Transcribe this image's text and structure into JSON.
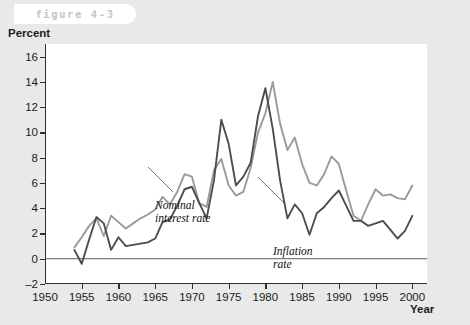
{
  "figure": {
    "tag": "figure 4-3"
  },
  "chart_data": {
    "type": "line",
    "title": "",
    "xlabel": "Year",
    "ylabel": "Percent",
    "xlim": [
      1950,
      2002
    ],
    "ylim": [
      -2,
      17
    ],
    "grid": false,
    "zero_line": true,
    "legend_position": "inline-annotations",
    "xticks": [
      1950,
      1955,
      1960,
      1965,
      1970,
      1975,
      1980,
      1985,
      1990,
      1995,
      2000
    ],
    "yticks": [
      -2,
      0,
      2,
      4,
      6,
      8,
      10,
      12,
      14,
      16
    ],
    "ytick_labels": [
      "–2",
      "0",
      "2",
      "4",
      "6",
      "8",
      "10",
      "12",
      "14",
      "16"
    ],
    "x": [
      1954,
      1955,
      1956,
      1957,
      1958,
      1959,
      1960,
      1961,
      1962,
      1963,
      1964,
      1965,
      1966,
      1967,
      1968,
      1969,
      1970,
      1971,
      1972,
      1973,
      1974,
      1975,
      1976,
      1977,
      1978,
      1979,
      1980,
      1981,
      1982,
      1983,
      1984,
      1985,
      1986,
      1987,
      1988,
      1989,
      1990,
      1991,
      1992,
      1993,
      1994,
      1995,
      1996,
      1997,
      1998,
      1999,
      2000
    ],
    "series": [
      {
        "name": "Nominal interest rate",
        "color": "#9a9a9a",
        "values": [
          0.9,
          1.7,
          2.6,
          3.2,
          1.8,
          3.4,
          2.9,
          2.4,
          2.8,
          3.2,
          3.5,
          3.9,
          4.9,
          4.3,
          5.3,
          6.7,
          6.5,
          4.4,
          4.1,
          7.0,
          7.9,
          5.8,
          5.0,
          5.3,
          7.2,
          10.0,
          11.5,
          14.0,
          10.7,
          8.6,
          9.6,
          7.5,
          6.0,
          5.8,
          6.7,
          8.1,
          7.5,
          5.4,
          3.4,
          3.0,
          4.3,
          5.5,
          5.0,
          5.1,
          4.8,
          4.7,
          5.8
        ]
      },
      {
        "name": "Inflation rate",
        "color": "#4d4d4d",
        "values": [
          0.7,
          -0.4,
          1.5,
          3.3,
          2.8,
          0.7,
          1.7,
          1.0,
          1.1,
          1.2,
          1.3,
          1.6,
          2.9,
          3.1,
          4.2,
          5.5,
          5.7,
          4.4,
          3.2,
          6.2,
          11.0,
          9.1,
          5.8,
          6.5,
          7.6,
          11.3,
          13.5,
          10.3,
          6.2,
          3.2,
          4.3,
          3.6,
          1.9,
          3.6,
          4.1,
          4.8,
          5.4,
          4.2,
          3.0,
          3.0,
          2.6,
          2.8,
          3.0,
          2.3,
          1.6,
          2.2,
          3.4
        ]
      }
    ],
    "annotations": [
      {
        "text": "Nominal\ninterest rate",
        "series": "Nominal interest rate"
      },
      {
        "text": "Inflation\nrate",
        "series": "Inflation rate"
      }
    ]
  }
}
